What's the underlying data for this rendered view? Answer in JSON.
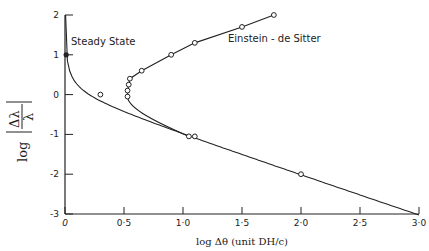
{
  "chart_data": {
    "type": "line",
    "title": "",
    "xlabel": "log Δθ (unit DH/c)",
    "ylabel": "log |Δλ/λ|",
    "xlim": [
      0,
      3.0
    ],
    "ylim": [
      -3,
      2
    ],
    "grid": false,
    "xticks": [
      "0",
      "0·5",
      "1·0",
      "1·5",
      "2·0",
      "2·5",
      "3·0"
    ],
    "yticks": [
      "2",
      "1",
      "0",
      "-1",
      "-2",
      "-3"
    ],
    "series": [
      {
        "name": "Steady State",
        "points": [
          [
            0.0,
            1.0
          ],
          [
            0.3,
            0.0
          ],
          [
            1.07,
            -1.05
          ],
          [
            2.0,
            -2.0
          ],
          [
            3.0,
            -3.0
          ]
        ]
      },
      {
        "name": "Einstein-de Sitter",
        "points": [
          [
            1.05,
            -1.05
          ],
          [
            0.53,
            -0.05
          ],
          [
            0.53,
            0.1
          ],
          [
            0.54,
            0.25
          ],
          [
            0.55,
            0.4
          ],
          [
            0.65,
            0.6
          ],
          [
            0.9,
            1.0
          ],
          [
            1.1,
            1.3
          ],
          [
            1.5,
            1.7
          ],
          [
            1.77,
            2.0
          ]
        ]
      }
    ],
    "annotations": [
      "Steady State",
      "Einstein-de Sitter"
    ]
  },
  "labels": {
    "steady_state": "Steady State",
    "eds": "Einstein - de Sitter",
    "xlabel_prefix": "log Δθ",
    "xlabel_unit": "(unit DH/c)",
    "ylabel_log": "log"
  }
}
